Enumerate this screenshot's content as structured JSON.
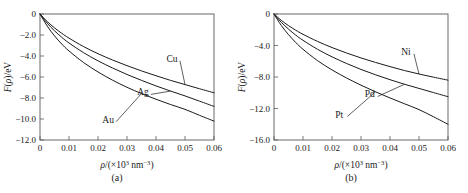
{
  "figure": {
    "panel_count": 2
  },
  "chart_data": [
    {
      "type": "line",
      "panel": "a",
      "caption": "(a)",
      "title": "",
      "xlabel": "ρ/(×10³ nm⁻³)",
      "ylabel": "F(ρ)/eV",
      "xlim": [
        0,
        0.06
      ],
      "ylim": [
        -12.0,
        0
      ],
      "xticks": [
        0,
        0.01,
        0.02,
        0.03,
        0.04,
        0.05,
        0.06
      ],
      "xtick_labels": [
        "0",
        "0.01",
        "0.02",
        "0.03",
        "0.04",
        "0.05",
        "0.06"
      ],
      "yticks": [
        0,
        -2.0,
        -4.0,
        -6.0,
        -8.0,
        -10.0,
        -12.0
      ],
      "ytick_labels": [
        "0",
        "−2.0",
        "−4.0",
        "−6.0",
        "−8.0",
        "−10.0",
        "−12.0"
      ],
      "grid": false,
      "legend": "inline-labels",
      "x": [
        0,
        0.0025,
        0.005,
        0.0075,
        0.01,
        0.015,
        0.02,
        0.025,
        0.03,
        0.035,
        0.04,
        0.045,
        0.05,
        0.055,
        0.06
      ],
      "series": [
        {
          "name": "Cu",
          "label": "Cu",
          "values": [
            0,
            -0.72,
            -1.32,
            -1.84,
            -2.3,
            -3.1,
            -3.78,
            -4.38,
            -4.92,
            -5.42,
            -5.88,
            -6.32,
            -6.72,
            -7.12,
            -7.5
          ]
        },
        {
          "name": "Ag",
          "label": "Ag",
          "values": [
            0,
            -0.88,
            -1.6,
            -2.22,
            -2.76,
            -3.68,
            -4.46,
            -5.14,
            -5.76,
            -6.32,
            -6.85,
            -7.34,
            -7.8,
            -8.3,
            -8.8
          ]
        },
        {
          "name": "Au",
          "label": "Au",
          "values": [
            0,
            -1.15,
            -2.08,
            -2.86,
            -3.52,
            -4.62,
            -5.52,
            -6.3,
            -6.98,
            -7.58,
            -8.12,
            -8.62,
            -9.08,
            -9.65,
            -10.2
          ]
        }
      ],
      "annotations": [
        {
          "text": "Cu",
          "x": 0.0455,
          "y": -4.55
        },
        {
          "text": "Ag",
          "x": 0.0355,
          "y": -7.75
        },
        {
          "text": "Au",
          "x": 0.0235,
          "y": -10.35
        }
      ]
    },
    {
      "type": "line",
      "panel": "b",
      "caption": "(b)",
      "title": "",
      "xlabel": "ρ/(×10³ nm⁻³)",
      "ylabel": "F(ρ)/eV",
      "xlim": [
        0,
        0.06
      ],
      "ylim": [
        -16.0,
        0
      ],
      "xticks": [
        0,
        0.01,
        0.02,
        0.03,
        0.04,
        0.05,
        0.06
      ],
      "xtick_labels": [
        "0",
        "0.01",
        "0.02",
        "0.03",
        "0.04",
        "0.05",
        "0.06"
      ],
      "yticks": [
        0,
        -4.0,
        -8.0,
        -12.0,
        -16.0
      ],
      "ytick_labels": [
        "0",
        "−4.0",
        "−8.0",
        "−12.0",
        "−16.0"
      ],
      "grid": false,
      "legend": "inline-labels",
      "x": [
        0,
        0.0025,
        0.005,
        0.0075,
        0.01,
        0.015,
        0.02,
        0.025,
        0.03,
        0.035,
        0.04,
        0.045,
        0.05,
        0.055,
        0.06
      ],
      "series": [
        {
          "name": "Ni",
          "label": "Ni",
          "values": [
            0,
            -0.8,
            -1.48,
            -2.06,
            -2.58,
            -3.48,
            -4.26,
            -4.95,
            -5.58,
            -6.15,
            -6.68,
            -7.18,
            -7.62,
            -8.02,
            -8.4
          ]
        },
        {
          "name": "Pd",
          "label": "Pd",
          "values": [
            0,
            -1.05,
            -1.92,
            -2.68,
            -3.34,
            -4.48,
            -5.44,
            -6.28,
            -7.04,
            -7.72,
            -8.34,
            -8.92,
            -9.45,
            -9.98,
            -10.5
          ]
        },
        {
          "name": "Pt",
          "label": "Pt",
          "values": [
            0,
            -1.45,
            -2.62,
            -3.62,
            -4.48,
            -5.92,
            -7.1,
            -8.12,
            -9.04,
            -9.88,
            -10.66,
            -11.4,
            -12.14,
            -13.05,
            -14.0
          ]
        }
      ],
      "annotations": [
        {
          "text": "Ni",
          "x": 0.0455,
          "y": -5.2
        },
        {
          "text": "Pd",
          "x": 0.033,
          "y": -10.6
        },
        {
          "text": "Pt",
          "x": 0.0225,
          "y": -13.15
        }
      ]
    }
  ]
}
